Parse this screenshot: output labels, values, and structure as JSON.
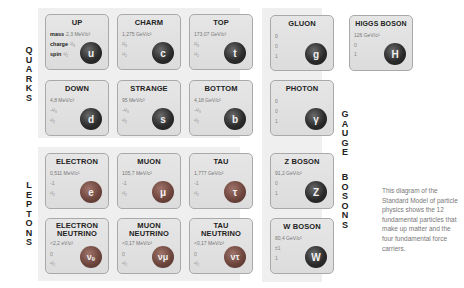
{
  "groups": {
    "quarks": "QUARKS",
    "leptons": "LEPTONS",
    "gauge_bosons_1": "GAUGE",
    "gauge_bosons_2": "BOSONS"
  },
  "legend": {
    "mass": "mass",
    "charge": "charge",
    "spin": "spin"
  },
  "quarks": [
    {
      "name": "UP",
      "mass": "2,3 MeV/c²",
      "charge": "²/₃",
      "spin": "¹/₂",
      "symbol": "u"
    },
    {
      "name": "CHARM",
      "mass": "1,275 GeV/c²",
      "charge": "²/₃",
      "spin": "¹/₂",
      "symbol": "c"
    },
    {
      "name": "TOP",
      "mass": "173,07 GeV/c²",
      "charge": "²/₃",
      "spin": "¹/₂",
      "symbol": "t"
    },
    {
      "name": "DOWN",
      "mass": "4,8 MeV/c²",
      "charge": "-¹/₃",
      "spin": "¹/₂",
      "symbol": "d"
    },
    {
      "name": "STRANGE",
      "mass": "95 MeV/c²",
      "charge": "-¹/₃",
      "spin": "¹/₂",
      "symbol": "s"
    },
    {
      "name": "BOTTOM",
      "mass": "4,18 GeV/c²",
      "charge": "-¹/₃",
      "spin": "¹/₂",
      "symbol": "b"
    }
  ],
  "leptons": [
    {
      "name": "ELECTRON",
      "mass": "0,511 MeV/c²",
      "charge": "-1",
      "spin": "¹/₂",
      "symbol": "e"
    },
    {
      "name": "MUON",
      "mass": "105,7 MeV/c²",
      "charge": "-1",
      "spin": "¹/₂",
      "symbol": "μ"
    },
    {
      "name": "TAU",
      "mass": "1,777 GeV/c²",
      "charge": "-1",
      "spin": "¹/₂",
      "symbol": "τ"
    },
    {
      "name1": "ELECTRON",
      "name2": "NEUTRINO",
      "mass": "<2,2 eV/c²",
      "charge": "0",
      "spin": "¹/₂",
      "symbol": "νₑ"
    },
    {
      "name1": "MUON",
      "name2": "NEUTRINO",
      "mass": "<0,17 MeV/c²",
      "charge": "0",
      "spin": "¹/₂",
      "symbol": "νμ"
    },
    {
      "name1": "TAU",
      "name2": "NEUTRINO",
      "mass": "<0,17 MeV/c²",
      "charge": "0",
      "spin": "¹/₂",
      "symbol": "ντ"
    }
  ],
  "gauge_bosons": [
    {
      "name": "GLUON",
      "mass": "0",
      "charge": "0",
      "spin": "1",
      "symbol": "g"
    },
    {
      "name": "PHOTON",
      "mass": "0",
      "charge": "0",
      "spin": "1",
      "symbol": "γ"
    },
    {
      "name": "Z BOSON",
      "mass": "91,2 GeV/c²",
      "charge": "0",
      "spin": "1",
      "symbol": "Z"
    },
    {
      "name": "W BOSON",
      "mass": "80,4 GeV/c²",
      "charge": "±1",
      "spin": "1",
      "symbol": "W"
    }
  ],
  "higgs": {
    "name": "HIGGS BOSON",
    "mass": "126 GeV/c²",
    "charge": "0",
    "spin": "1",
    "symbol": "H"
  },
  "description": "This diagram of the Standard Model of particle physics shows the 12 fundamental particles that make up matter and the four fundamental force carriers."
}
